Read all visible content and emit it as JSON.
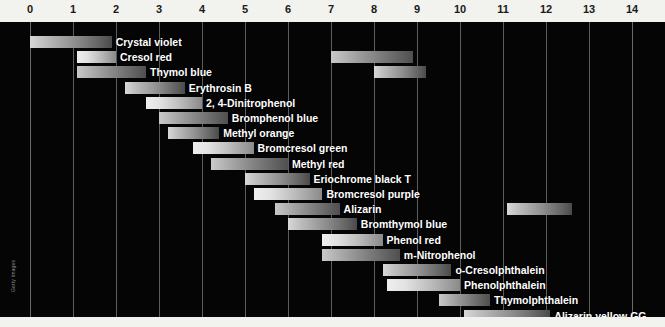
{
  "chart_data": {
    "type": "bar",
    "xlabel": "pH",
    "ylabel": "",
    "xlim": [
      0,
      14
    ],
    "grid": true,
    "legend": "none",
    "orientation": "horizontal-range",
    "axis_ticks": [
      0,
      1,
      2,
      3,
      4,
      5,
      6,
      7,
      8,
      9,
      10,
      11,
      12,
      13,
      14
    ],
    "tick_labels": [
      "0",
      "1",
      "2",
      "3",
      "4",
      "5",
      "6",
      "7",
      "8",
      "9",
      "10",
      "11",
      "12",
      "13",
      "14"
    ],
    "indicators": [
      {
        "name": "Crystal violet",
        "ranges": [
          [
            0.0,
            1.9
          ]
        ]
      },
      {
        "name": "Cresol red",
        "ranges": [
          [
            1.1,
            2.0
          ],
          [
            7.0,
            8.9
          ]
        ]
      },
      {
        "name": "Thymol blue",
        "ranges": [
          [
            1.1,
            2.7
          ],
          [
            8.0,
            9.2
          ]
        ]
      },
      {
        "name": "Erythrosin B",
        "ranges": [
          [
            2.2,
            3.6
          ]
        ]
      },
      {
        "name": "2, 4-Dinitrophenol",
        "ranges": [
          [
            2.7,
            4.0
          ]
        ]
      },
      {
        "name": "Bromphenol blue",
        "ranges": [
          [
            3.0,
            4.6
          ]
        ]
      },
      {
        "name": "Methyl orange",
        "ranges": [
          [
            3.2,
            4.4
          ]
        ]
      },
      {
        "name": "Bromcresol green",
        "ranges": [
          [
            3.8,
            5.2
          ]
        ]
      },
      {
        "name": "Methyl red",
        "ranges": [
          [
            4.2,
            6.0
          ]
        ]
      },
      {
        "name": "Eriochrome black T",
        "ranges": [
          [
            5.0,
            6.5
          ]
        ]
      },
      {
        "name": "Bromcresol purple",
        "ranges": [
          [
            5.2,
            6.8
          ]
        ]
      },
      {
        "name": "Alizarin",
        "ranges": [
          [
            5.7,
            7.2
          ],
          [
            11.1,
            12.6
          ]
        ]
      },
      {
        "name": "Bromthymol blue",
        "ranges": [
          [
            6.0,
            7.6
          ]
        ]
      },
      {
        "name": "Phenol red",
        "ranges": [
          [
            6.8,
            8.2
          ]
        ]
      },
      {
        "name": "m-Nitrophenol",
        "ranges": [
          [
            6.8,
            8.6
          ]
        ]
      },
      {
        "name": "o-Cresolphthalein",
        "ranges": [
          [
            8.2,
            9.8
          ]
        ]
      },
      {
        "name": "Phenolphthalein",
        "ranges": [
          [
            8.3,
            10.0
          ]
        ]
      },
      {
        "name": "Thymolphthalein",
        "ranges": [
          [
            9.5,
            10.7
          ]
        ]
      },
      {
        "name": "Alizarin yellow GG",
        "ranges": [
          [
            10.1,
            12.1
          ]
        ]
      }
    ]
  },
  "credit": {
    "text": "Getty Images"
  }
}
